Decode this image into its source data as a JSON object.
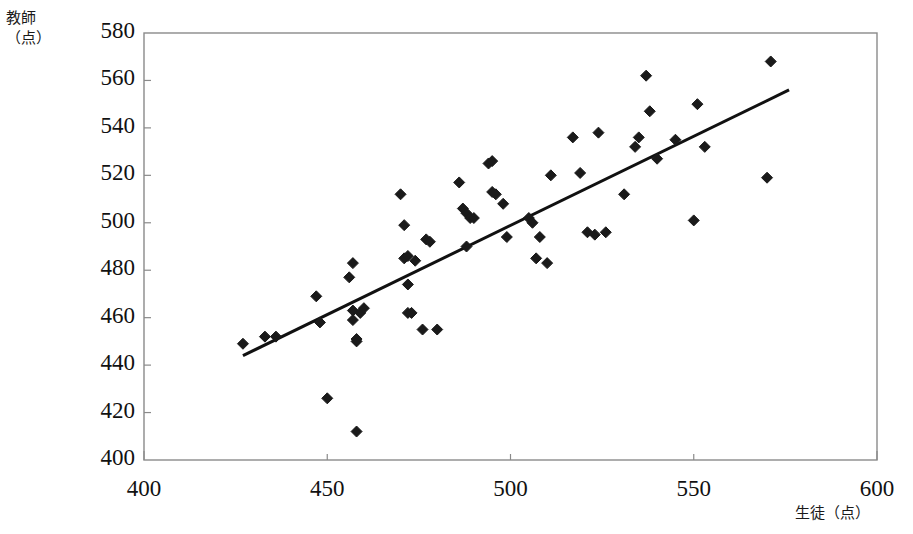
{
  "chart_data": {
    "type": "scatter",
    "title": "",
    "subtitle": "",
    "xlabel": "生徒（点）",
    "ylabel": "教師（点）",
    "xlim": [
      400,
      600
    ],
    "ylim": [
      400,
      580
    ],
    "xticks": [
      400,
      450,
      500,
      550,
      600
    ],
    "yticks": [
      400,
      420,
      440,
      460,
      480,
      500,
      520,
      540,
      560,
      580
    ],
    "grid": false,
    "legend": null,
    "legend_position": "none",
    "marker": "diamond",
    "marker_color": "#1a1a1a",
    "marker_size": 11,
    "frame_color": "#8a8a8a",
    "points": [
      [
        427,
        449
      ],
      [
        433,
        452
      ],
      [
        436,
        452
      ],
      [
        447,
        469
      ],
      [
        448,
        458
      ],
      [
        450,
        426
      ],
      [
        456,
        477
      ],
      [
        457,
        483
      ],
      [
        457,
        463
      ],
      [
        457,
        459
      ],
      [
        458,
        450
      ],
      [
        458,
        451
      ],
      [
        458,
        412
      ],
      [
        459,
        462
      ],
      [
        460,
        464
      ],
      [
        470,
        512
      ],
      [
        471,
        499
      ],
      [
        471,
        485
      ],
      [
        472,
        474
      ],
      [
        472,
        486
      ],
      [
        472,
        462
      ],
      [
        473,
        462
      ],
      [
        474,
        484
      ],
      [
        476,
        455
      ],
      [
        477,
        493
      ],
      [
        478,
        492
      ],
      [
        480,
        455
      ],
      [
        486,
        517
      ],
      [
        487,
        506
      ],
      [
        488,
        504
      ],
      [
        488,
        490
      ],
      [
        489,
        502
      ],
      [
        490,
        502
      ],
      [
        494,
        525
      ],
      [
        495,
        526
      ],
      [
        495,
        513
      ],
      [
        496,
        512
      ],
      [
        498,
        508
      ],
      [
        499,
        494
      ],
      [
        505,
        502
      ],
      [
        506,
        500
      ],
      [
        507,
        485
      ],
      [
        508,
        494
      ],
      [
        510,
        483
      ],
      [
        511,
        520
      ],
      [
        517,
        536
      ],
      [
        519,
        521
      ],
      [
        521,
        496
      ],
      [
        523,
        495
      ],
      [
        524,
        538
      ],
      [
        526,
        496
      ],
      [
        531,
        512
      ],
      [
        534,
        532
      ],
      [
        535,
        536
      ],
      [
        537,
        562
      ],
      [
        538,
        547
      ],
      [
        540,
        527
      ],
      [
        545,
        535
      ],
      [
        550,
        501
      ],
      [
        551,
        550
      ],
      [
        553,
        532
      ],
      [
        570,
        519
      ],
      [
        571,
        568
      ]
    ],
    "trendline": {
      "visible": true,
      "color": "#111111",
      "width": 3,
      "x_start": 427,
      "y_start": 444,
      "x_end": 576,
      "y_end": 556
    }
  }
}
